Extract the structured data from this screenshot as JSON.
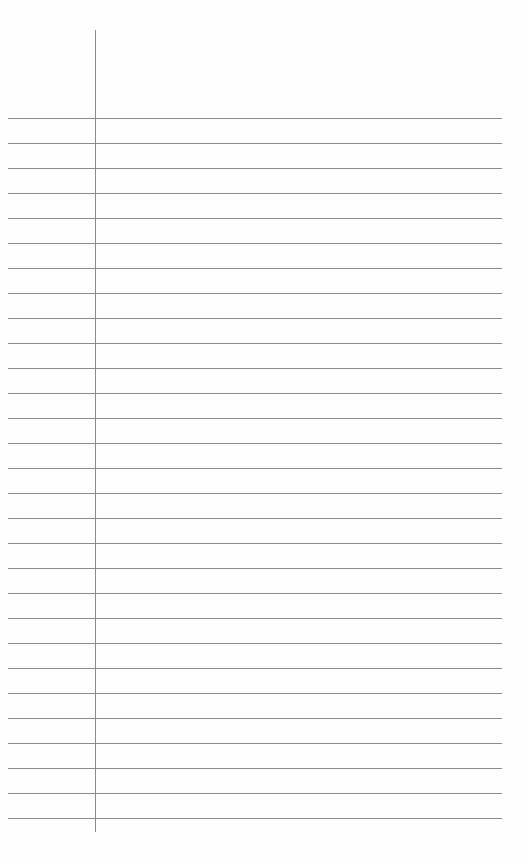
{
  "page": {
    "type": "lined-paper",
    "background_color": "#ffffff",
    "line_color": "#8c8c8c",
    "margin_line_color": "#8a8a8a"
  },
  "rules": {
    "count": 29,
    "first_y": 118,
    "spacing": 25,
    "left_x": 8,
    "right_x": 502
  },
  "margin": {
    "x": 95,
    "top_y": 30,
    "bottom_y": 832
  }
}
